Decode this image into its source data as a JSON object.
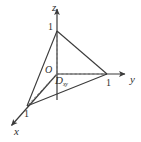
{
  "figure": {
    "width": 141,
    "height": 142,
    "background_color": "#ffffff",
    "line_color": "#3a3a3a",
    "dashed_color": "#6e6e6e",
    "text_color": "#303030"
  },
  "axes": {
    "z": {
      "label": "z",
      "tick_label": "1",
      "label_pos": {
        "x": 52,
        "y": 3
      },
      "tick_pos": {
        "x": 48,
        "y": 23
      },
      "line": {
        "x1": 57,
        "y1": 100,
        "x2": 57,
        "y2": 8
      },
      "arrow_at": {
        "x": 57,
        "y": 4
      }
    },
    "y": {
      "label": "y",
      "tick_label": "1",
      "label_pos": {
        "x": 130,
        "y": 75
      },
      "tick_pos": {
        "x": 106,
        "y": 79
      },
      "line": {
        "x1": 57,
        "y1": 74,
        "x2": 126,
        "y2": 74
      },
      "arrow_at": {
        "x": 130,
        "y": 74
      }
    },
    "x": {
      "label": "x",
      "tick_label": "1",
      "label_pos": {
        "x": 14,
        "y": 127
      },
      "tick_pos": {
        "x": 24,
        "y": 110
      },
      "line": {
        "x1": 57,
        "y1": 74,
        "x2": 11,
        "y2": 126
      },
      "arrow_at": {
        "x": 7,
        "y": 130
      }
    }
  },
  "origin": {
    "label": "O",
    "pos": {
      "x": 57,
      "y": 74
    },
    "label_pos": {
      "x": 45,
      "y": 66
    }
  },
  "region": {
    "label": "D",
    "subscript": "xy",
    "label_pos": {
      "x": 55,
      "y": 76
    }
  },
  "vertices": {
    "z_point": {
      "x": 57,
      "y": 31,
      "name": "point-0-0-1"
    },
    "y_point": {
      "x": 107,
      "y": 74,
      "name": "point-0-1-0"
    },
    "x_point": {
      "x": 27,
      "y": 106,
      "name": "point-1-0-0"
    }
  },
  "solid_edges": [
    {
      "name": "edge-z-to-y",
      "x1": 57,
      "y1": 31,
      "x2": 107,
      "y2": 74
    },
    {
      "name": "edge-z-to-x",
      "x1": 57,
      "y1": 31,
      "x2": 27,
      "y2": 106
    },
    {
      "name": "edge-x-to-y",
      "x1": 27,
      "y1": 106,
      "x2": 107,
      "y2": 74
    }
  ],
  "dashed_edges": [
    {
      "name": "dashed-z-to-origin",
      "x1": 57,
      "y1": 31,
      "x2": 57,
      "y2": 74
    },
    {
      "name": "dashed-origin-to-y",
      "x1": 57,
      "y1": 74,
      "x2": 107,
      "y2": 74
    },
    {
      "name": "dashed-origin-to-x",
      "x1": 57,
      "y1": 74,
      "x2": 27,
      "y2": 106
    }
  ]
}
